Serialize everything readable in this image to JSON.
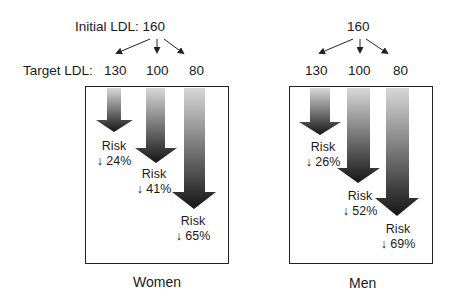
{
  "header": {
    "initial_label": "Initial LDL: 160",
    "initial_value_men": "160",
    "target_label": "Target LDL:",
    "targets": [
      "130",
      "100",
      "80"
    ]
  },
  "panels": [
    {
      "caption": "Women",
      "arrows": [
        {
          "target": "130",
          "risk_word": "Risk",
          "risk_change": "↓ 24%"
        },
        {
          "target": "100",
          "risk_word": "Risk",
          "risk_change": "↓ 41%"
        },
        {
          "target": "80",
          "risk_word": "Risk",
          "risk_change": "↓ 65%"
        }
      ]
    },
    {
      "caption": "Men",
      "arrows": [
        {
          "target": "130",
          "risk_word": "Risk",
          "risk_change": "↓ 26%"
        },
        {
          "target": "100",
          "risk_word": "Risk",
          "risk_change": "↓ 52%"
        },
        {
          "target": "80",
          "risk_word": "Risk",
          "risk_change": "↓ 69%"
        }
      ]
    }
  ],
  "colors": {
    "arrow_top": "#d8d8d8",
    "arrow_bottom": "#141414",
    "border": "#222222"
  }
}
